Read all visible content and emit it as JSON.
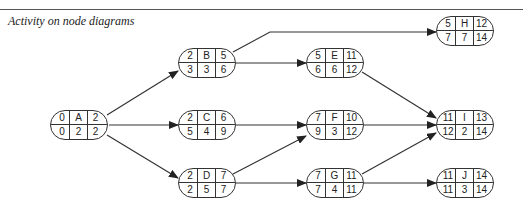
{
  "caption": "Activity on node diagrams",
  "nodes": {
    "A": {
      "es": "0",
      "label": "A",
      "ef": "2",
      "ls": "0",
      "dur": "2",
      "lf": "2"
    },
    "B": {
      "es": "2",
      "label": "B",
      "ef": "5",
      "ls": "3",
      "dur": "3",
      "lf": "6"
    },
    "C": {
      "es": "2",
      "label": "C",
      "ef": "6",
      "ls": "5",
      "dur": "4",
      "lf": "9"
    },
    "D": {
      "es": "2",
      "label": "D",
      "ef": "7",
      "ls": "2",
      "dur": "5",
      "lf": "7"
    },
    "E": {
      "es": "5",
      "label": "E",
      "ef": "11",
      "ls": "6",
      "dur": "6",
      "lf": "12"
    },
    "F": {
      "es": "7",
      "label": "F",
      "ef": "10",
      "ls": "9",
      "dur": "3",
      "lf": "12"
    },
    "G": {
      "es": "7",
      "label": "G",
      "ef": "11",
      "ls": "7",
      "dur": "4",
      "lf": "11"
    },
    "H": {
      "es": "5",
      "label": "H",
      "ef": "12",
      "ls": "7",
      "dur": "7",
      "lf": "14"
    },
    "I": {
      "es": "11",
      "label": "I",
      "ef": "13",
      "ls": "12",
      "dur": "2",
      "lf": "14"
    },
    "J": {
      "es": "11",
      "label": "J",
      "ef": "14",
      "ls": "11",
      "dur": "3",
      "lf": "14"
    }
  },
  "edges": [
    [
      "A",
      "B"
    ],
    [
      "A",
      "C"
    ],
    [
      "A",
      "D"
    ],
    [
      "B",
      "H"
    ],
    [
      "B",
      "E"
    ],
    [
      "C",
      "F"
    ],
    [
      "D",
      "F"
    ],
    [
      "D",
      "G"
    ],
    [
      "E",
      "I"
    ],
    [
      "F",
      "I"
    ],
    [
      "G",
      "I"
    ],
    [
      "G",
      "J"
    ]
  ]
}
